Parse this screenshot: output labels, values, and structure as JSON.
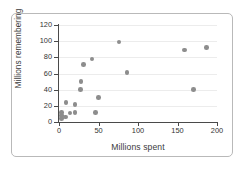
{
  "chart_data": {
    "type": "scatter",
    "title": "",
    "xlabel": "Millions spent",
    "ylabel": "Millions remembering",
    "xlim": [
      0,
      200
    ],
    "ylim": [
      0,
      120
    ],
    "xticks": [
      0,
      50,
      100,
      150,
      200
    ],
    "yticks": [
      0,
      20,
      40,
      60,
      80,
      100,
      120
    ],
    "xtick_labels": [
      "0",
      "50",
      "100",
      "150",
      "200"
    ],
    "ytick_labels": [
      "0",
      "20",
      "40",
      "60",
      "80",
      "100",
      "120"
    ],
    "grid": "horizontal",
    "legend": "none",
    "marker_color": "#8d8d8d",
    "points": [
      {
        "x": 3,
        "y": 4
      },
      {
        "x": 3,
        "y": 8
      },
      {
        "x": 3,
        "y": 12
      },
      {
        "x": 8,
        "y": 6
      },
      {
        "x": 9,
        "y": 24
      },
      {
        "x": 14,
        "y": 11
      },
      {
        "x": 20,
        "y": 22
      },
      {
        "x": 20,
        "y": 12
      },
      {
        "x": 27,
        "y": 40
      },
      {
        "x": 28,
        "y": 50
      },
      {
        "x": 31,
        "y": 71
      },
      {
        "x": 42,
        "y": 78
      },
      {
        "x": 46,
        "y": 12
      },
      {
        "x": 50,
        "y": 30
      },
      {
        "x": 76,
        "y": 99
      },
      {
        "x": 86,
        "y": 61
      },
      {
        "x": 159,
        "y": 89
      },
      {
        "x": 170,
        "y": 40
      },
      {
        "x": 187,
        "y": 92
      }
    ]
  },
  "figure": {
    "border_color": "#b9b9b9",
    "background": "#ffffff",
    "axis_color": "#4a4a4a",
    "gridline_color": "#ececec"
  }
}
